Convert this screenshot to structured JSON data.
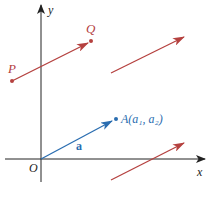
{
  "figure": {
    "axes": {
      "x_label": "x",
      "y_label": "y",
      "origin_label": "O",
      "color": "#222222"
    },
    "points": {
      "P": {
        "label": "P",
        "color": "#b5413f"
      },
      "Q": {
        "label": "Q",
        "color": "#b5413f"
      },
      "A": {
        "label": "A(a₁, a₂)",
        "color": "#2a6db0"
      }
    },
    "vector_a": {
      "label": "a",
      "color": "#2a6db0"
    },
    "colors": {
      "red_vectors": "#b5413f",
      "blue_vector": "#2a6db0"
    }
  }
}
